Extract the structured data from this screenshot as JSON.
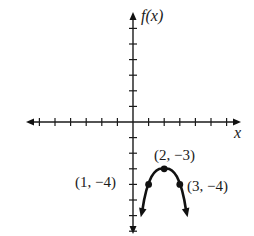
{
  "chart_data": {
    "type": "line",
    "title": "",
    "function": "f(x) = -(x - 2)^2 - 3",
    "xlabel": "x",
    "ylabel": "f(x)",
    "xlim": [
      -6.5,
      7
    ],
    "ylim": [
      -7,
      7
    ],
    "x_ticks": [
      -6,
      -5,
      -4,
      -3,
      -2,
      -1,
      1,
      2,
      3,
      4,
      5,
      6
    ],
    "y_ticks": [
      -7,
      -6,
      -5,
      -4,
      -3,
      -2,
      -1,
      1,
      2,
      3,
      4,
      5,
      6
    ],
    "tick_labels_shown": false,
    "grid": false,
    "legend": null,
    "curve": {
      "shape": "downward parabola",
      "ends_with_arrows": true,
      "x": [
        0.5,
        1,
        2,
        3,
        3.5
      ],
      "y": [
        -6.1,
        -4,
        -3,
        -4,
        -6.1
      ]
    },
    "points": [
      {
        "x": 1,
        "y": -4,
        "label": "(1, −4)"
      },
      {
        "x": 2,
        "y": -3,
        "label": "(2, −3)"
      },
      {
        "x": 3,
        "y": -4,
        "label": "(3, −4)"
      }
    ],
    "annotations": [
      "(1, −4)",
      "(2, −3)",
      "(3, −4)"
    ]
  },
  "labels": {
    "x_axis": "x",
    "y_axis": "f(x)",
    "point_left": "(1, −4)",
    "point_vertex": "(2, −3)",
    "point_right": "(3, −4)"
  },
  "colors": {
    "ink": "#111111",
    "background": "#ffffff"
  }
}
